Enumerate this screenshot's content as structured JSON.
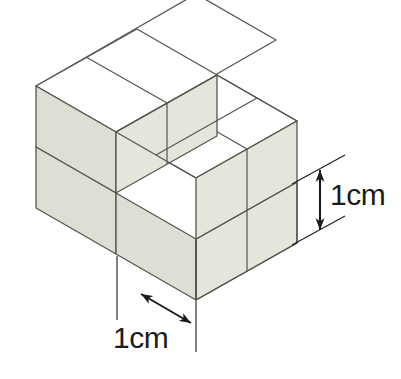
{
  "figure": {
    "background_color": "#ffffff"
  },
  "colors": {
    "top_face": "#ffffff",
    "left_face": "#dcdfd4",
    "right_face": "#e4e6dc",
    "edge_stroke": "#55564e",
    "dimension_stroke": "#1b1b1b",
    "label_text": "#1b1b1b"
  },
  "geometry": {
    "origin_x": 36,
    "origin_y": 208,
    "axis_x": {
      "dx": 80,
      "dy": 46
    },
    "axis_y": {
      "dx": 80,
      "dy": -46
    },
    "axis_z": {
      "dx": 0,
      "dy": -61
    },
    "unit_note": "Each cube edge represents 1 cm"
  },
  "cubes": [
    {
      "name": "back-left-lower",
      "x": 0,
      "y": 0,
      "z": 0
    },
    {
      "name": "back-right-lower",
      "x": 0,
      "y": 1,
      "z": 0
    },
    {
      "name": "back-left-upper",
      "x": 0,
      "y": 0,
      "z": 1
    },
    {
      "name": "back-right-upper",
      "x": 0,
      "y": 1,
      "z": 1
    },
    {
      "name": "front-left",
      "x": 1,
      "y": 0,
      "z": 0
    },
    {
      "name": "front-right",
      "x": 1,
      "y": 1,
      "z": 0
    }
  ],
  "dimensions": {
    "height": {
      "label": "1cm",
      "orientation": "vertical",
      "measures": "cube edge height",
      "arrow_style": "double-headed"
    },
    "depth": {
      "label": "1cm",
      "orientation": "diagonal",
      "measures": "cube edge depth",
      "arrow_style": "double-headed"
    }
  }
}
